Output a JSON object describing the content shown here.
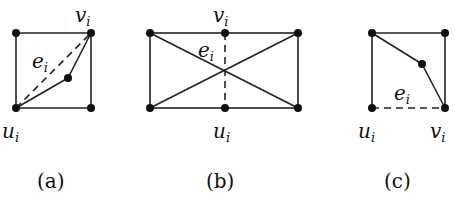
{
  "figure": {
    "panels": [
      {
        "id": "a",
        "caption": "(a)",
        "labels": {
          "v": "v",
          "v_sub": "i",
          "u": "u",
          "u_sub": "i",
          "e": "e",
          "e_sub": "i"
        },
        "description": "Square with corner vertices; solid path u_i → interior vertex → v_i; dashed edge e_i from u_i to v_i"
      },
      {
        "id": "b",
        "caption": "(b)",
        "labels": {
          "v": "v",
          "v_sub": "i",
          "u": "u",
          "u_sub": "i",
          "e": "e",
          "e_sub": "i"
        },
        "description": "Rectangle with two diagonals crossing; midpoint vertices v_i (top) and u_i (bottom) joined by dashed edge e_i"
      },
      {
        "id": "c",
        "caption": "(c)",
        "labels": {
          "v": "v",
          "v_sub": "i",
          "u": "u",
          "u_sub": "i",
          "e": "e",
          "e_sub": "i"
        },
        "description": "Square; solid path top-left → interior vertex → v_i; dashed bottom edge e_i from u_i to v_i"
      }
    ]
  }
}
